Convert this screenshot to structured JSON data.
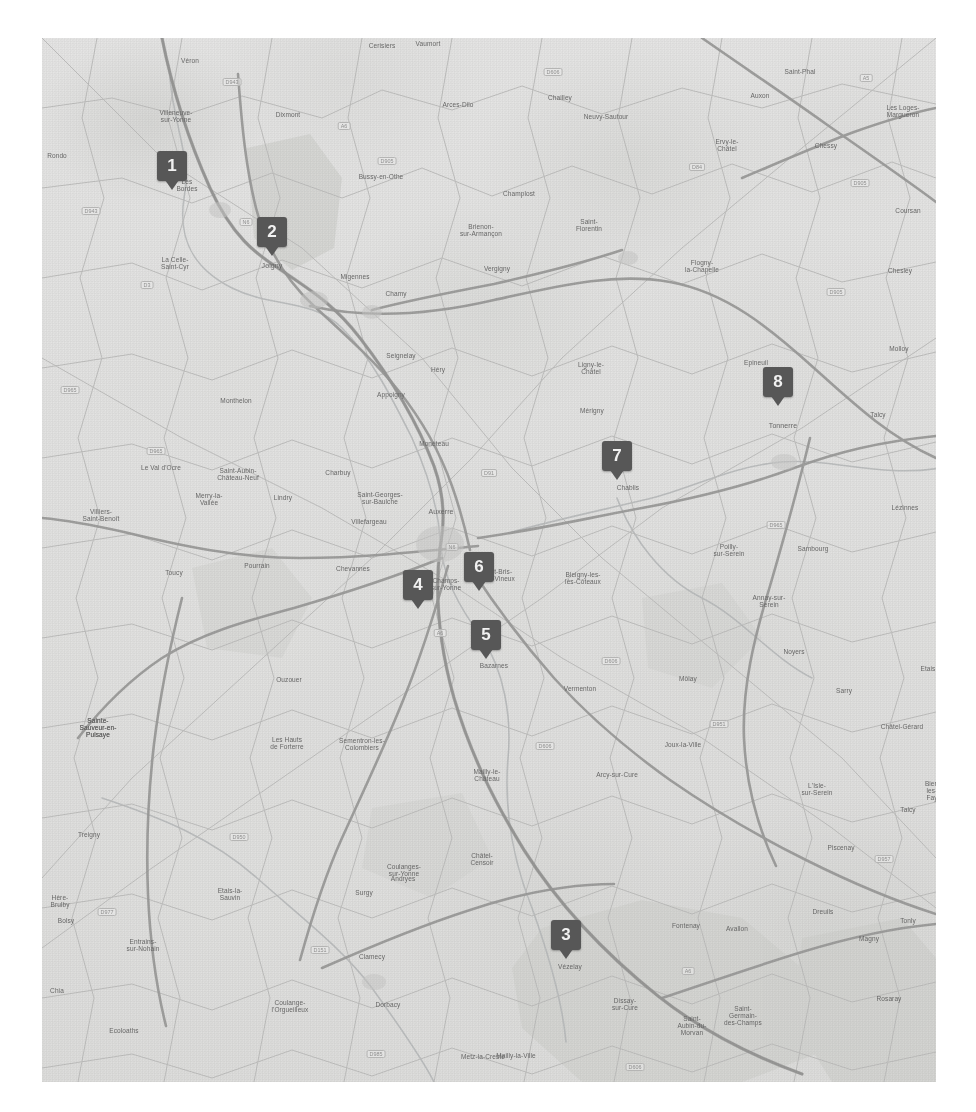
{
  "view": {
    "kind": "static-map-image",
    "region": "Auxerre / Yonne, Bourgogne, France",
    "canvas": {
      "width": 976,
      "height": 1112
    },
    "map_rect": {
      "x": 42,
      "y": 38,
      "width": 894,
      "height": 1044
    },
    "background_color": "#ffffff",
    "map_base_color": "#f0efec",
    "marker_color": "#4a4a4a",
    "marker_text_color": "#ffffff",
    "road_major_color": "#9a9a96",
    "road_minor_color": "#bdbdb8",
    "water_color": "#b9c3c6",
    "forest_color": "#d8dbcd"
  },
  "markers": [
    {
      "id": "1",
      "label": "1",
      "x": 172,
      "y": 166,
      "near": "Villeneuve-sur-Yonne"
    },
    {
      "id": "2",
      "label": "2",
      "x": 272,
      "y": 232,
      "near": "Joigny"
    },
    {
      "id": "3",
      "label": "3",
      "x": 566,
      "y": 935,
      "near": "Vézelay"
    },
    {
      "id": "4",
      "label": "4",
      "x": 418,
      "y": 585,
      "near": "Champs-sur-Yonne"
    },
    {
      "id": "5",
      "label": "5",
      "x": 486,
      "y": 635,
      "near": "Bazarnes"
    },
    {
      "id": "6",
      "label": "6",
      "x": 479,
      "y": 567,
      "near": "Saint-Bris-le-Vineux"
    },
    {
      "id": "7",
      "label": "7",
      "x": 617,
      "y": 456,
      "near": "Chablis"
    },
    {
      "id": "8",
      "label": "8",
      "x": 778,
      "y": 382,
      "near": "Tonnerre"
    }
  ],
  "places": [
    {
      "name": "Véron",
      "x": 190,
      "y": 57,
      "size": "s"
    },
    {
      "name": "Cerisiers",
      "x": 382,
      "y": 42,
      "size": "s"
    },
    {
      "name": "Vaumort",
      "x": 428,
      "y": 40,
      "size": "s"
    },
    {
      "name": "Saint-Phal",
      "x": 800,
      "y": 68,
      "size": "s"
    },
    {
      "name": "Auxon",
      "x": 760,
      "y": 92,
      "size": "s"
    },
    {
      "name": "Arces-Dilo",
      "x": 458,
      "y": 101,
      "size": "s"
    },
    {
      "name": "Chailley",
      "x": 560,
      "y": 94,
      "size": "s"
    },
    {
      "name": "Les Loges-\nMargueron",
      "x": 903,
      "y": 104,
      "size": "s"
    },
    {
      "name": "Villeneuve-\nsur-Yonne",
      "x": 176,
      "y": 109,
      "size": "s"
    },
    {
      "name": "Dixmont",
      "x": 288,
      "y": 111,
      "size": "s"
    },
    {
      "name": "Neuvy-Sautour",
      "x": 606,
      "y": 113,
      "size": "s"
    },
    {
      "name": "Ervy-le-\nChâtel",
      "x": 727,
      "y": 138,
      "size": "s"
    },
    {
      "name": "Chessy",
      "x": 826,
      "y": 142,
      "size": "s"
    },
    {
      "name": "Rondo",
      "x": 57,
      "y": 152,
      "size": "s"
    },
    {
      "name": "Les\nBordes",
      "x": 187,
      "y": 178,
      "size": "s"
    },
    {
      "name": "Champlost",
      "x": 519,
      "y": 190,
      "size": "s"
    },
    {
      "name": "Saint-\nFlorentin",
      "x": 589,
      "y": 218,
      "size": "s"
    },
    {
      "name": "Coursan",
      "x": 908,
      "y": 207,
      "size": "s"
    },
    {
      "name": "Bussy-en-Othe",
      "x": 381,
      "y": 173,
      "size": "s"
    },
    {
      "name": "Brienon-\nsur-Armançon",
      "x": 481,
      "y": 223,
      "size": "s"
    },
    {
      "name": "Joigny",
      "x": 272,
      "y": 262,
      "size": "m"
    },
    {
      "name": "La Celle-\nSaint-Cyr",
      "x": 175,
      "y": 256,
      "size": "s"
    },
    {
      "name": "Migennes",
      "x": 355,
      "y": 273,
      "size": "s"
    },
    {
      "name": "Chamy",
      "x": 396,
      "y": 290,
      "size": "s"
    },
    {
      "name": "Vergigny",
      "x": 497,
      "y": 265,
      "size": "s"
    },
    {
      "name": "Flogny-\nla-Chapelle",
      "x": 702,
      "y": 259,
      "size": "s"
    },
    {
      "name": "Chesley",
      "x": 900,
      "y": 267,
      "size": "s"
    },
    {
      "name": "Seignelay",
      "x": 401,
      "y": 352,
      "size": "s"
    },
    {
      "name": "Héry",
      "x": 438,
      "y": 366,
      "size": "s"
    },
    {
      "name": "Ligny-le-\nChâtel",
      "x": 591,
      "y": 361,
      "size": "s"
    },
    {
      "name": "Molloy",
      "x": 899,
      "y": 345,
      "size": "s"
    },
    {
      "name": "Epineuil",
      "x": 756,
      "y": 359,
      "size": "s"
    },
    {
      "name": "Monthelon",
      "x": 236,
      "y": 397,
      "size": "s"
    },
    {
      "name": "Appoigny",
      "x": 391,
      "y": 391,
      "size": "s"
    },
    {
      "name": "Mérigny",
      "x": 592,
      "y": 407,
      "size": "s"
    },
    {
      "name": "Tonnerre",
      "x": 783,
      "y": 422,
      "size": "m"
    },
    {
      "name": "Talcy",
      "x": 878,
      "y": 411,
      "size": "s"
    },
    {
      "name": "Monéteau",
      "x": 434,
      "y": 440,
      "size": "s"
    },
    {
      "name": "Le Val d'Ocre",
      "x": 161,
      "y": 464,
      "size": "s"
    },
    {
      "name": "Saint-Aubin-\nChâteau-Neuf",
      "x": 238,
      "y": 467,
      "size": "s"
    },
    {
      "name": "Charbuy",
      "x": 338,
      "y": 469,
      "size": "s"
    },
    {
      "name": "Saint-Georges-\nsur-Baulche",
      "x": 380,
      "y": 491,
      "size": "s"
    },
    {
      "name": "Auxerre",
      "x": 441,
      "y": 508,
      "size": "m"
    },
    {
      "name": "Chablis",
      "x": 628,
      "y": 484,
      "size": "s"
    },
    {
      "name": "Merry-la-\nVallée",
      "x": 209,
      "y": 492,
      "size": "s"
    },
    {
      "name": "Lindry",
      "x": 283,
      "y": 494,
      "size": "s"
    },
    {
      "name": "Villefargeau",
      "x": 369,
      "y": 518,
      "size": "s"
    },
    {
      "name": "Villiers-\nSaint-Benoît",
      "x": 101,
      "y": 508,
      "size": "s"
    },
    {
      "name": "Poilly-\nsur-Serein",
      "x": 729,
      "y": 543,
      "size": "s"
    },
    {
      "name": "Lézinnes",
      "x": 905,
      "y": 504,
      "size": "s"
    },
    {
      "name": "Sambourg",
      "x": 813,
      "y": 545,
      "size": "s"
    },
    {
      "name": "Toucy",
      "x": 174,
      "y": 569,
      "size": "s"
    },
    {
      "name": "Pourrain",
      "x": 257,
      "y": 562,
      "size": "s"
    },
    {
      "name": "Chevannes",
      "x": 353,
      "y": 565,
      "size": "s"
    },
    {
      "name": "Champs-\nsur-Yonne",
      "x": 446,
      "y": 577,
      "size": "s"
    },
    {
      "name": "St-Bris-\nle-Vineux",
      "x": 501,
      "y": 568,
      "size": "s"
    },
    {
      "name": "Bleigny-les-\nlès-Côteaux",
      "x": 583,
      "y": 571,
      "size": "s"
    },
    {
      "name": "Annay-sur-\nSerein",
      "x": 769,
      "y": 594,
      "size": "s"
    },
    {
      "name": "Vincelles",
      "x": 487,
      "y": 632,
      "size": "s"
    },
    {
      "name": "Bazarnes",
      "x": 494,
      "y": 662,
      "size": "s"
    },
    {
      "name": "Noyers",
      "x": 794,
      "y": 648,
      "size": "s"
    },
    {
      "name": "Ouzouer",
      "x": 289,
      "y": 676,
      "size": "s"
    },
    {
      "name": "Vermenton",
      "x": 580,
      "y": 685,
      "size": "s"
    },
    {
      "name": "Sarry",
      "x": 844,
      "y": 687,
      "size": "s"
    },
    {
      "name": "Môlay",
      "x": 688,
      "y": 675,
      "size": "s"
    },
    {
      "name": "Etais",
      "x": 928,
      "y": 665,
      "size": "s"
    },
    {
      "name": "Sainte-\nSauveur-en-\nPuisaye",
      "x": 98,
      "y": 717,
      "size": "s"
    },
    {
      "name": "Les Hauts\nde Forterre",
      "x": 287,
      "y": 736,
      "size": "s"
    },
    {
      "name": "Sementron-les-\nColombiers",
      "x": 362,
      "y": 737,
      "size": "s"
    },
    {
      "name": "Joux-la-Ville",
      "x": 683,
      "y": 741,
      "size": "s"
    },
    {
      "name": "Châtel-Gérard",
      "x": 902,
      "y": 723,
      "size": "s"
    },
    {
      "name": "Treigny",
      "x": 89,
      "y": 831,
      "size": "s"
    },
    {
      "name": "Mailly-le-\nChâteau",
      "x": 487,
      "y": 768,
      "size": "s"
    },
    {
      "name": "Arcy-sur-Cure",
      "x": 617,
      "y": 771,
      "size": "s"
    },
    {
      "name": "L'Isle-\nsur-Serein",
      "x": 817,
      "y": 782,
      "size": "s"
    },
    {
      "name": "Bier-\nles-\nFay",
      "x": 932,
      "y": 780,
      "size": "s"
    },
    {
      "name": "Coulanges-\nsur-Yonne",
      "x": 404,
      "y": 863,
      "size": "s"
    },
    {
      "name": "Andryes",
      "x": 403,
      "y": 875,
      "size": "s"
    },
    {
      "name": "Surgy",
      "x": 364,
      "y": 889,
      "size": "s"
    },
    {
      "name": "Etais-la-\nSauvin",
      "x": 230,
      "y": 887,
      "size": "s"
    },
    {
      "name": "Châtel-\nCensoir",
      "x": 482,
      "y": 852,
      "size": "s"
    },
    {
      "name": "Piscenay",
      "x": 841,
      "y": 844,
      "size": "s"
    },
    {
      "name": "Talcy",
      "x": 908,
      "y": 806,
      "size": "s"
    },
    {
      "name": "Sainte-\nSauveur-en-\nPuisaye",
      "x": 98,
      "y": 717,
      "size": "s"
    },
    {
      "name": "Bolsy",
      "x": 66,
      "y": 917,
      "size": "s"
    },
    {
      "name": "Hère-\nBrulby",
      "x": 60,
      "y": 894,
      "size": "s"
    },
    {
      "name": "Entrains-\nsur-Nohain",
      "x": 143,
      "y": 938,
      "size": "s"
    },
    {
      "name": "Clamecy",
      "x": 372,
      "y": 953,
      "size": "s"
    },
    {
      "name": "Fontenay",
      "x": 686,
      "y": 922,
      "size": "s"
    },
    {
      "name": "Avallon",
      "x": 737,
      "y": 925,
      "size": "s"
    },
    {
      "name": "Dreuils",
      "x": 823,
      "y": 908,
      "size": "s"
    },
    {
      "name": "Magny",
      "x": 869,
      "y": 935,
      "size": "s"
    },
    {
      "name": "Tonly",
      "x": 908,
      "y": 917,
      "size": "s"
    },
    {
      "name": "Vézelay",
      "x": 570,
      "y": 963,
      "size": "s"
    },
    {
      "name": "Chia",
      "x": 57,
      "y": 987,
      "size": "s"
    },
    {
      "name": "Coulange-\nl'Orgueilleux",
      "x": 290,
      "y": 999,
      "size": "s"
    },
    {
      "name": "Dorbacy",
      "x": 388,
      "y": 1001,
      "size": "s"
    },
    {
      "name": "Ecoloaths",
      "x": 124,
      "y": 1027,
      "size": "s"
    },
    {
      "name": "Dissay-\nsur-Cure",
      "x": 625,
      "y": 997,
      "size": "s"
    },
    {
      "name": "Saint-\nAubin-du-\nMorvan",
      "x": 692,
      "y": 1015,
      "size": "s"
    },
    {
      "name": "Saint-\nGermain-\ndes-Champs",
      "x": 743,
      "y": 1005,
      "size": "s"
    },
    {
      "name": "Rosaray",
      "x": 889,
      "y": 995,
      "size": "s"
    },
    {
      "name": "Mailly-la-Ville",
      "x": 516,
      "y": 1052,
      "size": "s"
    },
    {
      "name": "Metz-la-Creste",
      "x": 483,
      "y": 1053,
      "size": "s"
    }
  ],
  "road_shields": [
    {
      "label": "D943",
      "x": 232,
      "y": 78
    },
    {
      "label": "D606",
      "x": 553,
      "y": 68
    },
    {
      "label": "A5",
      "x": 866,
      "y": 74
    },
    {
      "label": "D905",
      "x": 387,
      "y": 157
    },
    {
      "label": "N6",
      "x": 246,
      "y": 218
    },
    {
      "label": "A6",
      "x": 344,
      "y": 122
    },
    {
      "label": "D84",
      "x": 697,
      "y": 163
    },
    {
      "label": "D905",
      "x": 860,
      "y": 179
    },
    {
      "label": "D943",
      "x": 91,
      "y": 207
    },
    {
      "label": "D3",
      "x": 147,
      "y": 281
    },
    {
      "label": "D905",
      "x": 836,
      "y": 288
    },
    {
      "label": "D965",
      "x": 70,
      "y": 386
    },
    {
      "label": "D965",
      "x": 156,
      "y": 447
    },
    {
      "label": "D91",
      "x": 489,
      "y": 469
    },
    {
      "label": "N6",
      "x": 452,
      "y": 543
    },
    {
      "label": "D965",
      "x": 776,
      "y": 521
    },
    {
      "label": "A6",
      "x": 440,
      "y": 629
    },
    {
      "label": "D606",
      "x": 611,
      "y": 657
    },
    {
      "label": "D951",
      "x": 719,
      "y": 720
    },
    {
      "label": "D606",
      "x": 545,
      "y": 742
    },
    {
      "label": "D950",
      "x": 239,
      "y": 833
    },
    {
      "label": "D957",
      "x": 884,
      "y": 855
    },
    {
      "label": "D977",
      "x": 107,
      "y": 908
    },
    {
      "label": "D151",
      "x": 320,
      "y": 946
    },
    {
      "label": "A6",
      "x": 688,
      "y": 967
    },
    {
      "label": "D985",
      "x": 376,
      "y": 1050
    },
    {
      "label": "D606",
      "x": 635,
      "y": 1063
    }
  ]
}
